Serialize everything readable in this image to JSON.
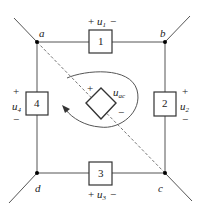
{
  "diagram": {
    "type": "circuit",
    "nodes": {
      "a": "a",
      "b": "b",
      "c": "c",
      "d": "d"
    },
    "elements": [
      {
        "id": "1",
        "label": "1",
        "voltage": "u",
        "sub": "1",
        "plus": "+",
        "minus": "−"
      },
      {
        "id": "2",
        "label": "2",
        "voltage": "u",
        "sub": "2",
        "plus": "+",
        "minus": "−"
      },
      {
        "id": "3",
        "label": "3",
        "voltage": "u",
        "sub": "3",
        "plus": "+",
        "minus": "−"
      },
      {
        "id": "4",
        "label": "4",
        "voltage": "u",
        "sub": "4",
        "plus": "+",
        "minus": "−"
      }
    ],
    "source": {
      "voltage": "u",
      "sub": "ac",
      "plus": "+",
      "minus": "−"
    },
    "colors": {
      "wire": "#555555",
      "box": "#333333",
      "dashed": "#777777",
      "node": "#000000"
    }
  }
}
